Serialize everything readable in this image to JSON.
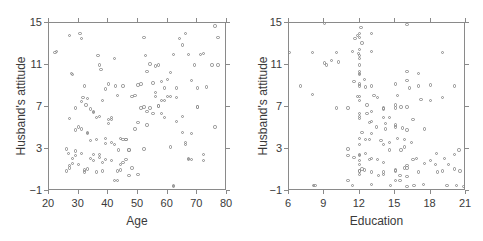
{
  "figure": {
    "background": "#ffffff",
    "marker_color": "#8d8d8d",
    "axis_color": "#8a8a8a",
    "text_color": "#3a3a3a"
  },
  "chart_data": [
    {
      "type": "scatter",
      "panel": "left",
      "title": "",
      "xlabel": "Age",
      "ylabel": "Husband's attitude",
      "xlim": [
        20,
        80
      ],
      "ylim": [
        -1,
        15
      ],
      "xticks": [
        20,
        30,
        40,
        50,
        60,
        70,
        80
      ],
      "yticks": [
        -1,
        3,
        7,
        11,
        15
      ],
      "grid": false,
      "legend": "none",
      "marker": "open-circle",
      "n_points": 150,
      "x": [
        22,
        22.5,
        27,
        27.5,
        28,
        29,
        30.5,
        31,
        31.5,
        32,
        32.5,
        33,
        34,
        35,
        36,
        36.5,
        37,
        37.5,
        38,
        39,
        40,
        41,
        42,
        42.5,
        43,
        43.5,
        44,
        45,
        46,
        47,
        48,
        49,
        50,
        51,
        52,
        52.5,
        53,
        54,
        55,
        56,
        57,
        58,
        59,
        60,
        61,
        62,
        63,
        64,
        65,
        66,
        67,
        68,
        69,
        70,
        71,
        72,
        73,
        75,
        76,
        77,
        26,
        26.5,
        27,
        28,
        29,
        30,
        31,
        32,
        33,
        34,
        35,
        36,
        37,
        38,
        39,
        40,
        41,
        42,
        43,
        44,
        45,
        46,
        47,
        48,
        49,
        50,
        51,
        52,
        53,
        54,
        55,
        56,
        57,
        58,
        59,
        60,
        61,
        62,
        63,
        65,
        66,
        67,
        68,
        70,
        72,
        76,
        26,
        27,
        28,
        29,
        30,
        31,
        32,
        33,
        34,
        35,
        36,
        37,
        38,
        39,
        40,
        41,
        42,
        43,
        44,
        45,
        46,
        47,
        50,
        52,
        53,
        56,
        57,
        58,
        59,
        61,
        62,
        63,
        65,
        66,
        67,
        68,
        70,
        72,
        77,
        27,
        29,
        31,
        33,
        35,
        37,
        39,
        41
      ],
      "y": [
        12.2,
        12.3,
        13.8,
        10.2,
        10.1,
        4.8,
        14.0,
        13.5,
        7.9,
        9.0,
        7.2,
        4.5,
        6.8,
        6.5,
        3.9,
        11.9,
        11.0,
        10.6,
        7.6,
        8.7,
        9.2,
        5.8,
        11.6,
        9.0,
        8.1,
        2.9,
        1.0,
        9.0,
        3.9,
        2.9,
        8.0,
        8.1,
        9.1,
        9.2,
        13.6,
        11.9,
        10.4,
        11.1,
        9.3,
        10.9,
        11.0,
        9.4,
        8.8,
        9.6,
        10.3,
        12.0,
        8.8,
        13.5,
        12.9,
        14.0,
        12.0,
        9.5,
        11.0,
        7.0,
        12.0,
        12.1,
        8.9,
        11.0,
        14.7,
        13.6,
        3.0,
        2.6,
        1.4,
        1.6,
        2.4,
        5.1,
        4.9,
        1.0,
        4.6,
        3.8,
        2.5,
        6.0,
        2.5,
        1.7,
        4.0,
        5.8,
        1.9,
        0.0,
        0.9,
        4.0,
        3.9,
        3.9,
        2.9,
        1.2,
        4.9,
        5.5,
        6.9,
        7.0,
        6.6,
        6.9,
        6.4,
        8.0,
        7.1,
        6.4,
        7.6,
        8.0,
        3.2,
        -0.5,
        5.6,
        4.6,
        3.6,
        2.1,
        4.5,
        7.0,
        2.5,
        5.1,
        0.9,
        1.2,
        2.1,
        2.8,
        1.5,
        2.6,
        0.8,
        1.1,
        2.1,
        1.9,
        0.8,
        2.2,
        0.9,
        2.0,
        5.4,
        3.6,
        3.4,
        0.0,
        1.5,
        1.7,
        2.0,
        0.5,
        0.6,
        3.0,
        5.3,
        8.4,
        7.1,
        7.6,
        6.0,
        8.0,
        -0.6,
        7.9,
        6.1,
        3.4,
        2.0,
        2.0,
        8.8,
        1.9,
        11.0,
        5.9,
        6.9,
        7.5,
        7.8,
        6.6,
        6.1,
        3.5,
        6.0
      ]
    },
    {
      "type": "scatter",
      "panel": "right",
      "title": "",
      "xlabel": "Education",
      "ylabel": "Husband's attitude",
      "xlim": [
        6,
        21
      ],
      "ylim": [
        -1,
        15
      ],
      "xticks": [
        6,
        9,
        12,
        15,
        18,
        21
      ],
      "yticks": [
        -1,
        3,
        7,
        11,
        15
      ],
      "grid": false,
      "legend": "none",
      "marker": "open-circle",
      "n_points": 150,
      "x": [
        6.0,
        7.0,
        8.0,
        8.1,
        9.0,
        9.2,
        9.6,
        10.0,
        10.2,
        11.0,
        11.4,
        11.6,
        11.8,
        11.9,
        12.0,
        12.0,
        12.0,
        12.0,
        12.0,
        12.0,
        12.0,
        12.0,
        12.0,
        12.0,
        12.0,
        12.0,
        12.1,
        12.2,
        12.4,
        12.5,
        12.6,
        12.8,
        13.0,
        13.0,
        13.0,
        13.2,
        13.5,
        14.0,
        14.0,
        14.2,
        14.5,
        15.0,
        15.0,
        15.2,
        15.5,
        15.6,
        15.8,
        16.0,
        16.0,
        16.2,
        16.5,
        17.0,
        17.2,
        18.0,
        18.5,
        19.0,
        19.2,
        20.0,
        20.4,
        21.0,
        8.0,
        9.0,
        10.0,
        11.0,
        11.5,
        11.8,
        12.0,
        12.0,
        12.0,
        12.0,
        12.0,
        12.0,
        12.2,
        12.5,
        12.8,
        13.0,
        13.0,
        13.4,
        13.8,
        14.0,
        14.2,
        14.5,
        15.0,
        15.0,
        15.2,
        15.5,
        15.8,
        16.0,
        16.0,
        16.4,
        16.8,
        17.0,
        17.5,
        18.0,
        18.4,
        19.0,
        19.5,
        20.0,
        20.5,
        11.0,
        11.5,
        12.0,
        12.0,
        12.0,
        12.0,
        12.2,
        12.5,
        12.8,
        13.0,
        13.0,
        13.5,
        14.0,
        14.0,
        14.5,
        15.0,
        15.0,
        15.4,
        15.8,
        16.0,
        16.0,
        16.5,
        17.0,
        17.5,
        18.0,
        19.0,
        20.0,
        20.8,
        8.2,
        11.0,
        11.4,
        12.0,
        12.0,
        12.4,
        13.0,
        13.6,
        14.0,
        14.6,
        15.0,
        15.4,
        16.0,
        16.0,
        16.6,
        17.4,
        18.6,
        19.4,
        20.2,
        21.0,
        12.0,
        12.6,
        13.0,
        14.0,
        15.0,
        16.0
      ],
      "y": [
        12.2,
        9.0,
        8.2,
        -0.5,
        15.0,
        11.0,
        11.4,
        6.9,
        11.3,
        3.0,
        12.3,
        13.5,
        13.8,
        12.1,
        14.0,
        13.6,
        12.5,
        11.9,
        11.0,
        10.2,
        10.1,
        9.2,
        8.0,
        7.6,
        5.9,
        2.4,
        14.6,
        13.1,
        9.6,
        8.9,
        7.2,
        5.5,
        14.0,
        12.3,
        9.0,
        8.1,
        7.9,
        6.8,
        3.4,
        5.4,
        6.0,
        9.2,
        6.9,
        8.1,
        7.0,
        5.0,
        3.9,
        10.4,
        9.5,
        8.8,
        5.8,
        10.2,
        7.7,
        9.1,
        2.6,
        12.2,
        2.1,
        9.0,
        2.9,
        1.8,
        12.2,
        11.2,
        12.2,
        6.9,
        9.4,
        8.0,
        11.6,
        10.4,
        9.0,
        6.4,
        4.0,
        2.5,
        4.6,
        3.9,
        2.0,
        6.6,
        4.5,
        5.1,
        3.8,
        6.9,
        4.9,
        3.6,
        7.2,
        5.1,
        4.0,
        2.9,
        1.2,
        7.0,
        4.8,
        3.6,
        2.1,
        9.0,
        4.9,
        7.6,
        1.5,
        7.9,
        1.5,
        2.5,
        0.9,
        2.4,
        2.2,
        1.9,
        1.5,
        0.9,
        3.4,
        1.1,
        2.6,
        3.9,
        2.1,
        0.8,
        2.0,
        0.6,
        1.7,
        2.9,
        0.0,
        1.0,
        0.5,
        3.2,
        1.4,
        1.2,
        2.0,
        0.8,
        1.6,
        1.9,
        0.9,
        1.1,
        -0.6,
        -0.5,
        0.0,
        -0.5,
        0.9,
        0.6,
        1.0,
        -0.4,
        0.5,
        0.8,
        -0.5,
        0.9,
        0.0,
        -0.6,
        0.4,
        -0.5,
        -0.4,
        0.8,
        -0.5,
        -0.5,
        5.8,
        6.1,
        6.4,
        5.6,
        6.0,
        5.3
      ]
    }
  ]
}
